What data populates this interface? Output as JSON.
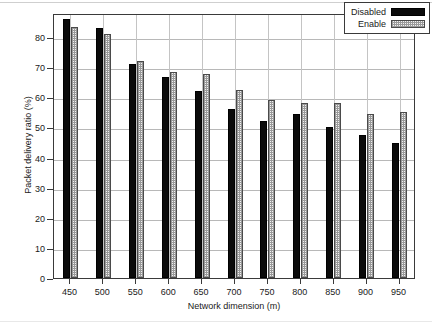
{
  "chart_data": {
    "type": "bar",
    "title": "",
    "subtitle": "",
    "xlabel": "Network dimension (m)",
    "ylabel": "Packet delivery ratio (%)",
    "categories": [
      "450",
      "500",
      "550",
      "600",
      "650",
      "700",
      "750",
      "800",
      "850",
      "900",
      "950"
    ],
    "series": [
      {
        "name": "Disabled",
        "fill": "solid-black",
        "color": "#0b0b0b",
        "values": [
          86,
          83,
          71,
          66.7,
          62,
          56,
          52,
          54.5,
          50.3,
          47.5,
          45
        ]
      },
      {
        "name": "Enable",
        "fill": "dotted-hatch",
        "color": "#f2f2f2",
        "values": [
          83.5,
          81,
          72,
          68.5,
          67.8,
          62.5,
          59,
          58.2,
          58.2,
          54.5,
          55
        ]
      }
    ],
    "ylim": [
      0,
      88
    ],
    "yticks": [
      0,
      10,
      20,
      30,
      40,
      50,
      60,
      70,
      80
    ],
    "ytick_labels": [
      "0",
      "10",
      "20",
      "30",
      "40",
      "50",
      "60",
      "70",
      "80"
    ],
    "xticks": [
      "450",
      "500",
      "550",
      "600",
      "650",
      "700",
      "750",
      "800",
      "850",
      "900",
      "950"
    ],
    "grid": "both",
    "legend_position": "top-right",
    "legend_entries": [
      "Disabled",
      "Enable"
    ]
  }
}
